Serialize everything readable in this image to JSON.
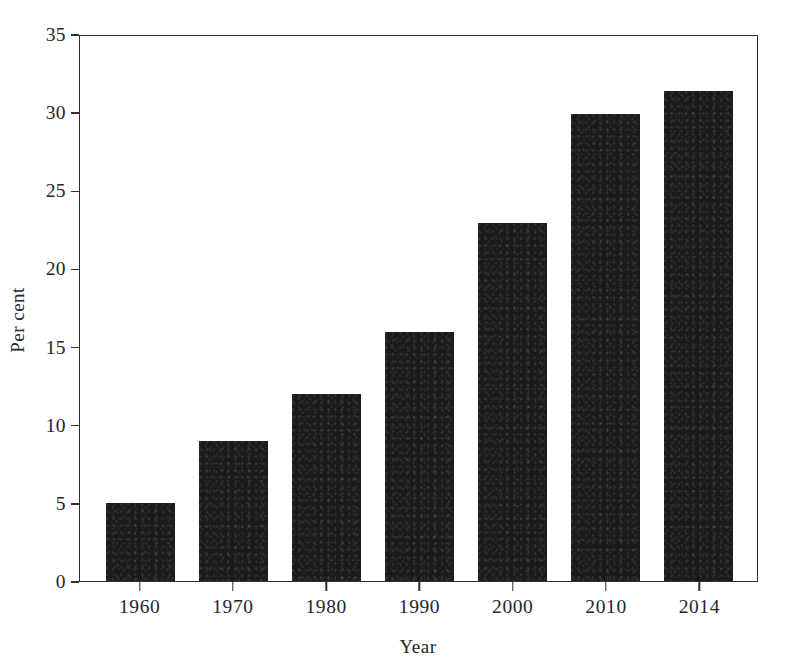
{
  "chart_data": {
    "type": "bar",
    "title": "",
    "subtitle": "",
    "xlabel": "Year",
    "ylabel": "Per cent",
    "categories": [
      "1960",
      "1970",
      "1980",
      "1990",
      "2000",
      "2010",
      "2014"
    ],
    "values": [
      5,
      9,
      12,
      16,
      23,
      30,
      31.5
    ],
    "series": [
      {
        "name": "Per cent",
        "values": [
          5,
          9,
          12,
          16,
          23,
          30,
          31.5
        ]
      }
    ],
    "ylim": [
      0,
      35
    ],
    "ytick_labels": [
      "0",
      "5",
      "10",
      "15",
      "20",
      "25",
      "30",
      "35"
    ],
    "ytick_values": [
      0,
      5,
      10,
      15,
      20,
      25,
      30,
      35
    ],
    "grid": false,
    "legend": false,
    "legend_position": "none",
    "bar_color": "#1b1b1b",
    "frame_color": "#2f2f33",
    "background_color": "#ffffff",
    "annotations": []
  }
}
